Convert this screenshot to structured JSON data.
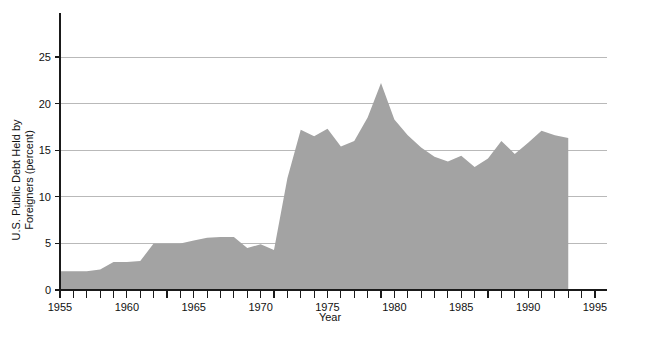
{
  "chart_data": {
    "type": "area",
    "title": "",
    "xlabel": "Year",
    "ylabel": "U.S. Public Debt Held by Foreigners (percent)",
    "ylabel_line1": "U.S. Public Debt Held by",
    "ylabel_line2": "Foreigners (percent)",
    "xlim": [
      1955,
      1995
    ],
    "ylim": [
      0,
      27.5
    ],
    "y_ticks": [
      0,
      5,
      10,
      15,
      20,
      25
    ],
    "y_tick_labels": [
      "0",
      "5",
      "10",
      "15",
      "20",
      "25"
    ],
    "x_ticks": [
      1955,
      1960,
      1965,
      1970,
      1975,
      1980,
      1985,
      1990,
      1995
    ],
    "x_tick_labels": [
      "1955",
      "1960",
      "1965",
      "1970",
      "1975",
      "1980",
      "1985",
      "1990",
      "1995"
    ],
    "x_minor_tick_interval": 1,
    "grid": "horizontal",
    "legend": "none",
    "series_name": "U.S. Public Debt Held by Foreigners",
    "series_color": "#a3a3a3",
    "x": [
      1955,
      1956,
      1957,
      1958,
      1959,
      1960,
      1961,
      1962,
      1963,
      1964,
      1965,
      1966,
      1967,
      1968,
      1969,
      1970,
      1971,
      1972,
      1973,
      1974,
      1975,
      1976,
      1977,
      1978,
      1979,
      1980,
      1981,
      1982,
      1983,
      1984,
      1985,
      1986,
      1987,
      1988,
      1989,
      1990,
      1991,
      1992,
      1993
    ],
    "values": [
      2.0,
      2.0,
      2.0,
      2.2,
      3.0,
      3.0,
      3.1,
      5.0,
      5.0,
      5.0,
      5.3,
      5.6,
      5.7,
      5.7,
      4.5,
      4.9,
      4.3,
      12.0,
      17.2,
      16.5,
      17.3,
      15.4,
      16.0,
      18.5,
      22.2,
      18.3,
      16.6,
      15.3,
      14.3,
      13.8,
      14.4,
      13.2,
      14.1,
      16.0,
      14.6,
      15.8,
      17.1,
      16.6,
      16.3
    ]
  }
}
